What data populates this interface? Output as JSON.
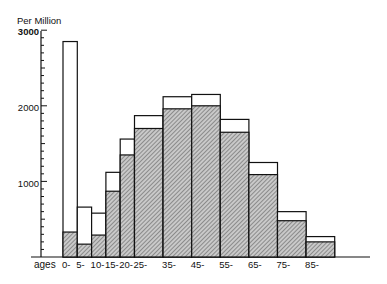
{
  "chart_data": {
    "type": "bar",
    "title": "",
    "ylabel": "Per Million",
    "xlabel": "ages",
    "ylim": [
      0,
      3000
    ],
    "yticks": [
      1000,
      2000,
      3000
    ],
    "ytick_labels": [
      "1000",
      "2000",
      "3000"
    ],
    "grid": false,
    "legend": [],
    "categories": [
      "0-",
      "5-",
      "10-",
      "15-",
      "20-",
      "25-",
      "35-",
      "45-",
      "55-",
      "65-",
      "75-",
      "85-"
    ],
    "bin_edges": [
      0,
      5,
      10,
      15,
      20,
      25,
      35,
      45,
      55,
      65,
      75,
      85,
      95
    ],
    "series": [
      {
        "name": "total (outline)",
        "style": "open",
        "values": [
          2850,
          660,
          580,
          1120,
          1560,
          1870,
          2120,
          2150,
          1820,
          1250,
          600,
          270
        ]
      },
      {
        "name": "hatched portion",
        "style": "hatched",
        "values": [
          330,
          170,
          290,
          870,
          1350,
          1700,
          1960,
          2000,
          1650,
          1090,
          480,
          200
        ]
      }
    ]
  },
  "labels": {
    "y_title": "Per Million",
    "x_title": "ages",
    "y_3000": "3000",
    "y_2000": "2000",
    "y_1000": "1000"
  }
}
